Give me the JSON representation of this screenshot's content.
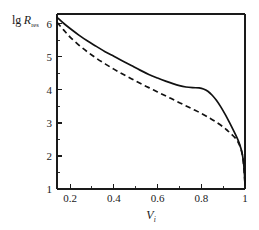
{
  "chart_data": {
    "type": "line",
    "title": "",
    "xlabel": "V_i",
    "ylabel": "lg R_res",
    "ylabel_main": "lg",
    "ylabel_symbol": "R",
    "ylabel_subscript": "res",
    "xlabel_symbol": "V",
    "xlabel_subscript": "i",
    "xlim": [
      0.14,
      1.0
    ],
    "ylim": [
      1.0,
      6.3
    ],
    "xticks": [
      0.2,
      0.4,
      0.6,
      0.8,
      1
    ],
    "xticklabels": [
      "0.2",
      "0.4",
      "0.6",
      "0.8",
      "1"
    ],
    "xticks_minor": [
      0.1,
      0.3,
      0.5,
      0.7,
      0.9
    ],
    "yticks": [
      1,
      2,
      3,
      4,
      5,
      6
    ],
    "yticklabels": [
      "1",
      "2",
      "3",
      "4",
      "5",
      "6"
    ],
    "yticks_minor": [
      1.5,
      2.5,
      3.5,
      4.5,
      5.5
    ],
    "grid": false,
    "legend": "none",
    "axis_color": "#1a1a1a",
    "curve_color": "#111111",
    "series": [
      {
        "name": "solid-curve",
        "style": "solid",
        "x": [
          0.14,
          0.17,
          0.2,
          0.24,
          0.28,
          0.32,
          0.36,
          0.4,
          0.44,
          0.48,
          0.52,
          0.56,
          0.6,
          0.64,
          0.67,
          0.7,
          0.73,
          0.76,
          0.79,
          0.81,
          0.83,
          0.85,
          0.87,
          0.89,
          0.91,
          0.93,
          0.95,
          0.96,
          0.97,
          0.98,
          0.988,
          0.994,
          0.998,
          1.0
        ],
        "y": [
          6.2,
          6.02,
          5.86,
          5.66,
          5.48,
          5.32,
          5.16,
          5.02,
          4.88,
          4.74,
          4.6,
          4.47,
          4.36,
          4.26,
          4.19,
          4.13,
          4.09,
          4.07,
          4.06,
          4.03,
          3.96,
          3.84,
          3.68,
          3.48,
          3.25,
          3.0,
          2.74,
          2.6,
          2.45,
          2.26,
          2.05,
          1.75,
          1.4,
          1.12
        ]
      },
      {
        "name": "dashed-curve",
        "style": "dashed",
        "x": [
          0.14,
          0.17,
          0.2,
          0.24,
          0.28,
          0.32,
          0.36,
          0.4,
          0.44,
          0.48,
          0.52,
          0.56,
          0.6,
          0.64,
          0.68,
          0.72,
          0.76,
          0.8,
          0.84,
          0.87,
          0.9,
          0.92,
          0.94,
          0.955,
          0.965,
          0.975,
          0.985,
          0.992,
          0.997,
          1.0
        ],
        "y": [
          6.05,
          5.82,
          5.6,
          5.36,
          5.15,
          4.96,
          4.79,
          4.63,
          4.48,
          4.34,
          4.2,
          4.07,
          3.94,
          3.81,
          3.68,
          3.55,
          3.42,
          3.29,
          3.14,
          3.02,
          2.88,
          2.77,
          2.65,
          2.55,
          2.46,
          2.33,
          2.12,
          1.85,
          1.45,
          1.12
        ]
      }
    ]
  },
  "figure": {
    "plot_left_px": 57,
    "plot_right_px": 245,
    "plot_top_px": 14,
    "plot_bottom_px": 189
  }
}
